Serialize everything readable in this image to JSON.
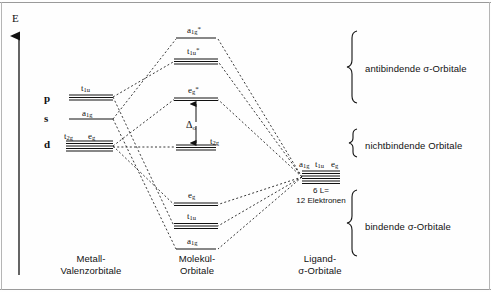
{
  "figure": {
    "type": "molecular-orbital-diagram",
    "language": "de",
    "energy_axis_label": "E",
    "ink_color": "#111111"
  },
  "columns": {
    "metal": {
      "caption_line1": "Metall-",
      "caption_line2": "Valenzorbitale"
    },
    "molecule": {
      "caption_line1": "Molekül-",
      "caption_line2": "Orbitale"
    },
    "ligand": {
      "caption_line1": "Ligand-",
      "caption_line2": "σ-Orbitale"
    }
  },
  "metal_levels": [
    {
      "shell": "p",
      "term": "t",
      "sub": "1u",
      "sup": "",
      "degeneracy": 3,
      "y": 97
    },
    {
      "shell": "s",
      "term": "a",
      "sub": "1g",
      "sup": "",
      "degeneracy": 1,
      "y": 119
    },
    {
      "shell": "d",
      "term": "t",
      "sub": "2g",
      "sup": "",
      "degeneracy": 3,
      "y": 146
    },
    {
      "shell": "",
      "term": "e",
      "sub": "g",
      "sup": "",
      "degeneracy": 2,
      "y": 146
    }
  ],
  "metal_shell_labels": [
    {
      "label": "p",
      "y": 100
    },
    {
      "label": "s",
      "y": 120
    },
    {
      "label": "d",
      "y": 146
    }
  ],
  "molecular_levels": [
    {
      "term": "a",
      "sub": "1g",
      "sup": "*",
      "degeneracy": 1,
      "y": 38,
      "kind": "antibonding"
    },
    {
      "term": "t",
      "sub": "1u",
      "sup": "*",
      "degeneracy": 3,
      "y": 62,
      "kind": "antibonding"
    },
    {
      "term": "e",
      "sub": "g",
      "sup": "*",
      "degeneracy": 2,
      "y": 100,
      "kind": "antibonding"
    },
    {
      "term": "t",
      "sub": "2g",
      "sup": "",
      "degeneracy": 3,
      "y": 147,
      "kind": "nonbonding"
    },
    {
      "term": "e",
      "sub": "g",
      "sup": "",
      "degeneracy": 2,
      "y": 205,
      "kind": "bonding"
    },
    {
      "term": "t",
      "sub": "1u",
      "sup": "",
      "degeneracy": 3,
      "y": 226,
      "kind": "bonding"
    },
    {
      "term": "a",
      "sub": "1g",
      "sup": "",
      "degeneracy": 1,
      "y": 249,
      "kind": "bonding"
    }
  ],
  "ligand_level": {
    "terms": [
      {
        "term": "a",
        "sub": "1g"
      },
      {
        "term": "t",
        "sub": "1u"
      },
      {
        "term": "e",
        "sub": "g"
      }
    ],
    "degeneracy": 6,
    "y": 176,
    "count_line1": "6 L=",
    "count_line2": "12 Elektronen"
  },
  "splitting": {
    "symbol": "Δ",
    "subscript": "o",
    "from_y": 103,
    "to_y": 144
  },
  "brackets": [
    {
      "id": "antibonding",
      "label": "antibindende σ-Orbitale",
      "top": 30,
      "bottom": 110,
      "label_y": 63
    },
    {
      "id": "nonbonding",
      "label": "nichtbindende Orbitale",
      "top": 128,
      "bottom": 165,
      "label_y": 140
    },
    {
      "id": "bonding",
      "label": "bindende σ-Orbitale",
      "top": 190,
      "bottom": 265,
      "label_y": 221
    }
  ]
}
